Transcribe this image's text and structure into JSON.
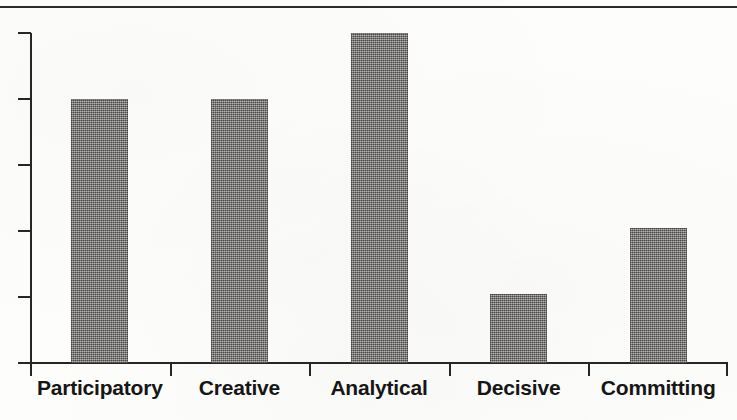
{
  "chart_data": {
    "type": "bar",
    "title": "",
    "subtitle": "",
    "xlabel": "",
    "ylabel": "",
    "categories": [
      "Participatory",
      "Creative",
      "Analytical",
      "Decisive",
      "Committing"
    ],
    "values": [
      4.0,
      4.0,
      5.0,
      1.05,
      2.05
    ],
    "ylim": [
      0,
      5
    ],
    "y_ticks": [
      0,
      1,
      2,
      3,
      4,
      5
    ],
    "y_tick_labels": [
      "",
      "",
      "",
      "",
      "",
      ""
    ],
    "grid": false,
    "legend": null,
    "bar_color": "#888583",
    "axis_color": "#262626",
    "background_color": "#fdfdfc",
    "annotations": []
  },
  "figure": {
    "top_rule": true
  },
  "axis": {
    "y_tick_count": 6,
    "x_tick_count": 6
  }
}
